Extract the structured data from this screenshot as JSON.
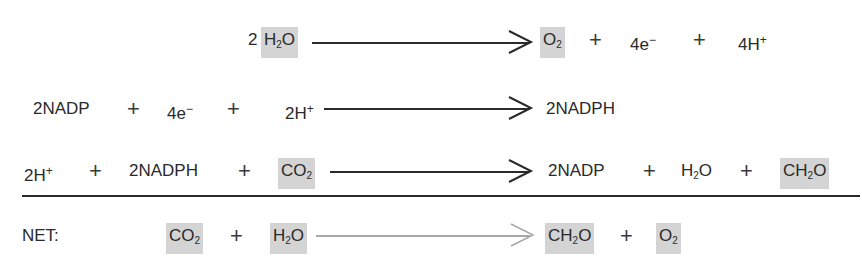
{
  "diagram": {
    "title": "",
    "reactions": [
      {
        "id": "water-splitting",
        "reactants": [
          "2 H2O"
        ],
        "products": [
          "O2",
          "4e-",
          "4H+"
        ],
        "highlighted": [
          "H2O",
          "O2"
        ]
      },
      {
        "id": "nadp-reduction",
        "reactants": [
          "2NADP",
          "4e-",
          "2H+"
        ],
        "products": [
          "2NADPH"
        ],
        "highlighted": []
      },
      {
        "id": "carbon-fixation",
        "reactants": [
          "2H+",
          "2NADPH",
          "CO2"
        ],
        "products": [
          "2NADP",
          "H2O",
          "CH2O"
        ],
        "highlighted": [
          "CO2",
          "CH2O"
        ]
      },
      {
        "id": "net",
        "label": "NET:",
        "reactants": [
          "CO2",
          "H2O"
        ],
        "products": [
          "CH2O",
          "O2"
        ],
        "highlighted": [
          "CO2",
          "H2O",
          "CH2O",
          "O2"
        ]
      }
    ],
    "labels": {
      "r1_coef": "2",
      "r1_h": "H",
      "r1_h_sub": "2",
      "r1_o": "O",
      "r1_o2": "O",
      "r1_o2_sub": "2",
      "r1_e": "4e",
      "r1_e_sup": "−",
      "r1_hplus": "4H",
      "r1_hplus_sup": "+",
      "r2_nadp": "2NADP",
      "r2_e": "4e",
      "r2_e_sup": "−",
      "r2_hplus": "2H",
      "r2_hplus_sup": "+",
      "r2_nadph": "2NADPH",
      "r3_hplus": "2H",
      "r3_hplus_sup": "+",
      "r3_nadph": "2NADPH",
      "r3_co": "CO",
      "r3_co_sub": "2",
      "r3_nadp": "2NADP",
      "r3_h": "H",
      "r3_h_sub": "2",
      "r3_o": "O",
      "r3_ch": "CH",
      "r3_ch_sub": "2",
      "r3_cho": "O",
      "net_label": "NET:",
      "net_co": "CO",
      "net_co_sub": "2",
      "net_h": "H",
      "net_h_sub": "2",
      "net_o": "O",
      "net_ch": "CH",
      "net_ch_sub": "2",
      "net_cho": "O",
      "net_o2": "O",
      "net_o2_sub": "2",
      "plus": "+"
    },
    "colors": {
      "highlight": "#d4d4d4",
      "text": "#2a2a2a",
      "arrow": "#2a2a2a",
      "net_arrow": "#a8a8a8"
    }
  }
}
